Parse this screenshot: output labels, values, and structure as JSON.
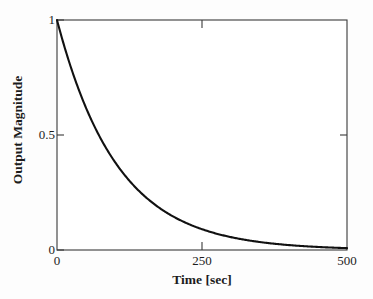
{
  "chart_data": {
    "type": "line",
    "title": "",
    "subtitle": "",
    "xlabel": "Time [sec]",
    "ylabel": "Output Magnitude",
    "xlim": [
      0,
      500
    ],
    "ylim": [
      0,
      1
    ],
    "xticks": [
      0,
      250,
      500
    ],
    "xtick_labels": [
      "0",
      "250",
      "500"
    ],
    "yticks": [
      0,
      0.5,
      1
    ],
    "ytick_labels": [
      "0",
      "0.5",
      "1"
    ],
    "grid": false,
    "legend": null,
    "annotations": [],
    "series": [
      {
        "name": "output magnitude",
        "description": "first-order exponential decay, y = exp(-t/104)",
        "color": "#111111",
        "linewidth": 2,
        "x": [
          0,
          10,
          20,
          30,
          40,
          50,
          60,
          70,
          80,
          90,
          100,
          120,
          140,
          160,
          180,
          200,
          225,
          250,
          275,
          300,
          325,
          350,
          375,
          400,
          425,
          450,
          475,
          500
        ],
        "y": [
          1.0,
          0.908,
          0.825,
          0.749,
          0.681,
          0.618,
          0.562,
          0.51,
          0.463,
          0.421,
          0.382,
          0.316,
          0.26,
          0.215,
          0.177,
          0.147,
          0.115,
          0.091,
          0.071,
          0.056,
          0.044,
          0.034,
          0.027,
          0.021,
          0.017,
          0.013,
          0.01,
          0.008
        ]
      }
    ]
  },
  "axes": {
    "x_tick_0": "0",
    "x_tick_250": "250",
    "x_tick_500": "500",
    "y_tick_0": "0",
    "y_tick_05": "0.5",
    "y_tick_1": "1",
    "x_axis_title": "Time [sec]",
    "y_axis_title": "Output Magnitude"
  },
  "style": {
    "background": "#fdfdfd",
    "axis_color": "#3a3a3a",
    "curve_color": "#111111",
    "text_color": "#1c1c1c"
  }
}
